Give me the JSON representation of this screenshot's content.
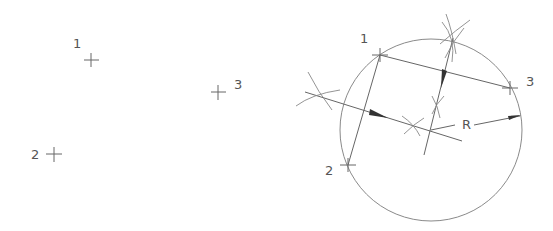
{
  "diagram": {
    "title": "",
    "colors": {
      "background": "#ffffff",
      "line": "#666666",
      "construction": "#888888",
      "circle": "#8a8a8a",
      "arrow": "#333333",
      "text": "#555555"
    },
    "left_panel": {
      "points": [
        {
          "id": "1",
          "label": "1",
          "x": 91,
          "y": 60,
          "label_x": 73,
          "label_y": 48
        },
        {
          "id": "2",
          "label": "2",
          "x": 54,
          "y": 154,
          "label_x": 31,
          "label_y": 159
        },
        {
          "id": "3",
          "label": "3",
          "x": 218,
          "y": 92,
          "label_x": 234,
          "label_y": 89
        }
      ]
    },
    "right_panel": {
      "points": [
        {
          "id": "1",
          "label": "1",
          "x": 380,
          "y": 55,
          "label_x": 360,
          "label_y": 43
        },
        {
          "id": "2",
          "label": "2",
          "x": 348,
          "y": 165,
          "label_x": 325,
          "label_y": 175
        },
        {
          "id": "3",
          "label": "3",
          "x": 510,
          "y": 88,
          "label_x": 526,
          "label_y": 86
        }
      ],
      "circle": {
        "cx": 431,
        "cy": 130,
        "r": 91
      },
      "center": {
        "x": 431,
        "y": 130
      },
      "radius_label": {
        "text": "R",
        "x": 462,
        "y": 129
      }
    }
  }
}
